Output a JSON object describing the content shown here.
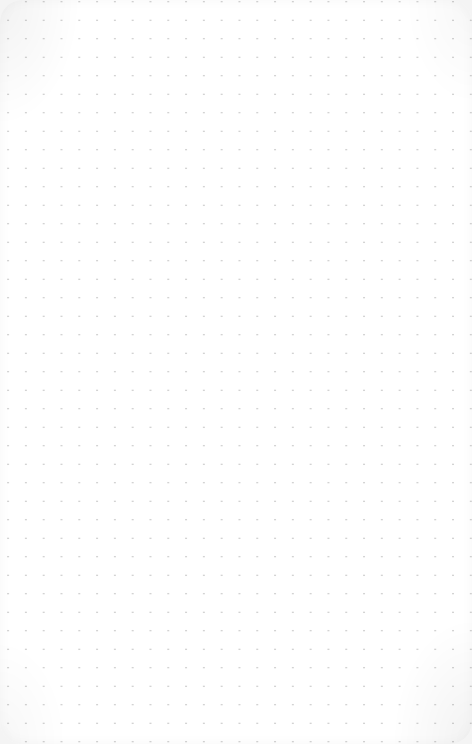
{
  "canvas": {
    "type": "dot-grid",
    "background_color": "#ffffff",
    "dot_color": "#c4c4c4",
    "dot_spacing_x": 17.8,
    "dot_spacing_y": 18.5,
    "content": ""
  }
}
